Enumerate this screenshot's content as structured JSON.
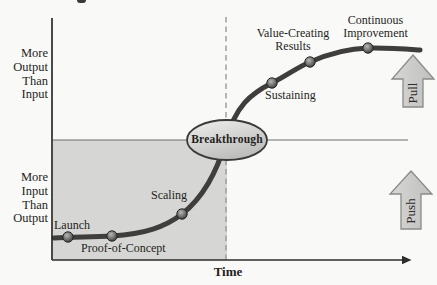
{
  "diagram": {
    "type": "s-curve",
    "sequence": [
      "Launch",
      "Proof-of-Concept",
      "Scaling",
      "Breakthrough",
      "Sustaining",
      "Value-Creating Results",
      "Continuous Improvement"
    ],
    "regions": {
      "upper": "More Output Than Input (Pull)",
      "lower": "More Input Than Output (Push)"
    }
  },
  "axes": {
    "y_upper_lines": [
      "More",
      "Output",
      "Than",
      "Input"
    ],
    "y_lower_lines": [
      "More",
      "Input",
      "Than",
      "Output"
    ],
    "x_label": "Time"
  },
  "labels": {
    "launch": "Launch",
    "proof_of_concept": "Proof-of-Concept",
    "scaling": "Scaling",
    "sustaining": "Sustaining",
    "value_creating_line1": "Value-Creating",
    "value_creating_line2": "Results",
    "continuous_line1": "Continuous",
    "continuous_line2": "Improvement",
    "breakthrough": "Breakthrough"
  },
  "arrows": {
    "pull": "Pull",
    "push": "Push"
  },
  "colors": {
    "background": "#f9f9f7",
    "shaded_region": "#d6d6d4",
    "curve": "#3f3e3c",
    "axis": "#2b2b29",
    "dashed_line": "#9a9a98",
    "midline": "#6e6e6c",
    "arrow_fill": "#cccccb",
    "arrow_stroke": "#8a8a88",
    "text": "#1f1f1d"
  }
}
